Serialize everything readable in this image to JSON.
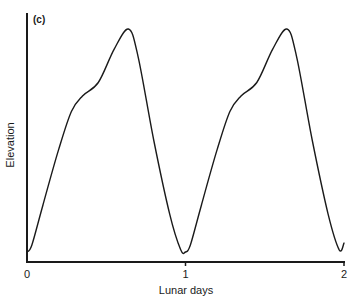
{
  "chart_data": {
    "type": "line",
    "panel_label": "(c)",
    "title": "",
    "xlabel": "Lunar days",
    "ylabel": "Elevation",
    "xlim": [
      0,
      2
    ],
    "ylim": [
      0,
      1
    ],
    "x_ticks": [
      0,
      1,
      2
    ],
    "x_tick_labels": [
      "0",
      "1",
      "2"
    ],
    "y_ticks": [],
    "grid": false,
    "legend": null,
    "series": [
      {
        "name": "Elevation (relative)",
        "x": [
          0.0,
          0.03,
          0.1,
          0.2,
          0.28,
          0.35,
          0.45,
          0.55,
          0.64,
          0.7,
          0.8,
          0.9,
          0.97,
          1.0,
          1.03,
          1.1,
          1.2,
          1.28,
          1.35,
          1.45,
          1.55,
          1.64,
          1.7,
          1.8,
          1.9,
          1.97,
          2.0
        ],
        "y": [
          0.0,
          0.03,
          0.21,
          0.46,
          0.63,
          0.7,
          0.76,
          0.91,
          1.0,
          0.88,
          0.5,
          0.17,
          0.01,
          0.0,
          0.03,
          0.21,
          0.46,
          0.63,
          0.7,
          0.76,
          0.91,
          1.0,
          0.88,
          0.5,
          0.17,
          0.01,
          0.04
        ]
      }
    ],
    "colors": {
      "line": "#1a1a1a",
      "axis": "#1a1a1a",
      "background": "#ffffff"
    }
  }
}
